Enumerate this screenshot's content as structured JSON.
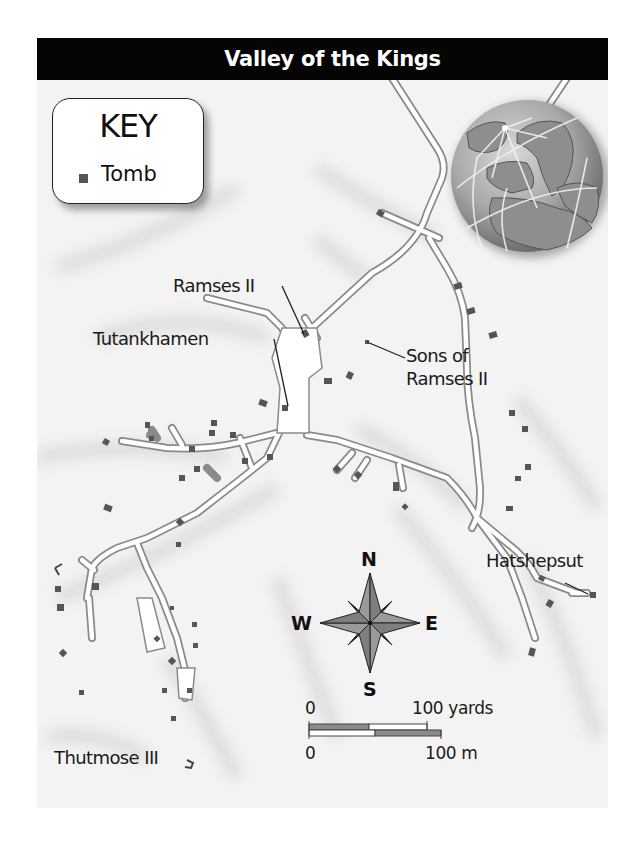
{
  "title": "Valley of the Kings",
  "key": {
    "heading": "KEY",
    "items": [
      {
        "symbol": "square",
        "color": "#555555",
        "label": "Tomb"
      }
    ]
  },
  "labels": {
    "ramses_ii": "Ramses II",
    "tutankhamen": "Tutankhamen",
    "sons_of_ramses_line1": "Sons of",
    "sons_of_ramses_line2": "Ramses II",
    "hatshepsut": "Hatshepsut",
    "thutmose_iii": "Thutmose III"
  },
  "compass": {
    "north": "N",
    "south": "S",
    "east": "E",
    "west": "W"
  },
  "scale_bar": {
    "top_zero": "0",
    "top_max": "100 yards",
    "bottom_zero": "0",
    "bottom_max": "100 m"
  },
  "locator_globe": {
    "region_shown": "Europe, North Africa, Arctic"
  },
  "colors": {
    "title_bar": "#050505",
    "tomb": "#555555",
    "road_fill": "#ffffff",
    "road_outline": "#8a8a8a",
    "terrain": "#f3f3f3",
    "globe_land": "#9a9a9a",
    "globe_ocean": "#8c8c8c"
  }
}
